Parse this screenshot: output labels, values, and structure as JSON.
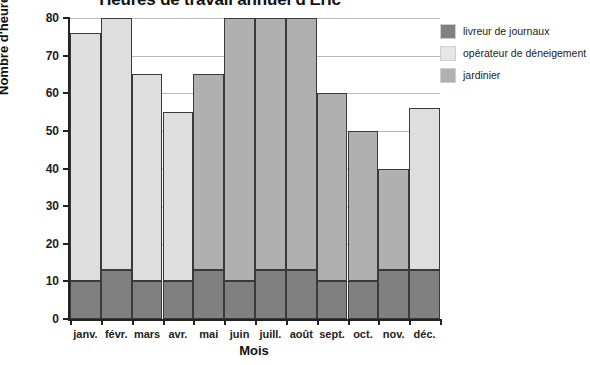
{
  "chart_data": {
    "type": "bar",
    "title": "Heures de travail annuel d'Éric",
    "xlabel": "Mois",
    "ylabel": "Nombre d'heures",
    "categories": [
      "janv.",
      "févr.",
      "mars",
      "avr.",
      "mai",
      "juin",
      "juill.",
      "août",
      "sept.",
      "oct.",
      "nov.",
      "déc."
    ],
    "ylim": [
      0,
      80
    ],
    "yticks": [
      0,
      10,
      20,
      30,
      40,
      50,
      60,
      70,
      80
    ],
    "grid": true,
    "stacked": true,
    "legend_position": "right",
    "series": [
      {
        "name": "livreur de journaux",
        "color": "#808080",
        "values": [
          10,
          13,
          10,
          10,
          13,
          10,
          13,
          13,
          10,
          10,
          13,
          13
        ]
      },
      {
        "name": "opérateur de déneigement",
        "color": "#dedede",
        "values": [
          66,
          67,
          55,
          45,
          0,
          0,
          0,
          0,
          0,
          0,
          0,
          43
        ]
      },
      {
        "name": "jardinier",
        "color": "#b0b0b0",
        "values": [
          0,
          0,
          0,
          0,
          52,
          70,
          67,
          67,
          50,
          40,
          27,
          0
        ]
      }
    ],
    "totals": [
      76,
      80,
      65,
      55,
      65,
      80,
      80,
      80,
      60,
      50,
      40,
      56
    ]
  },
  "legend": {
    "items": [
      {
        "label": "livreur de journaux",
        "color": "#808080"
      },
      {
        "label": "opérateur de déneigement",
        "color": "#e6e6e6"
      },
      {
        "label": "jardinier",
        "color": "#b0b0b0"
      }
    ]
  }
}
